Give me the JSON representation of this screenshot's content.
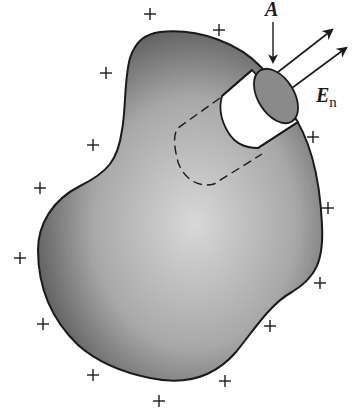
{
  "diagram": {
    "labels": {
      "area": "A",
      "field_main": "E",
      "field_subscript": "n"
    },
    "colors": {
      "ink": "#1a1a1a",
      "conductor_dark": "#4a4a4a",
      "conductor_light": "#d6d6d6",
      "end_cap": "#8a8a8a",
      "background": "#ffffff"
    },
    "surface_charges": {
      "symbol": "+",
      "count": 15,
      "positions": [
        [
          150,
          14
        ],
        [
          219,
          30
        ],
        [
          106,
          73
        ],
        [
          93,
          145
        ],
        [
          40,
          188
        ],
        [
          20,
          258
        ],
        [
          43,
          324
        ],
        [
          93,
          375
        ],
        [
          159,
          401
        ],
        [
          225,
          381
        ],
        [
          270,
          326
        ],
        [
          320,
          283
        ],
        [
          328,
          208
        ],
        [
          313,
          137
        ]
      ]
    },
    "field_arrows": 2,
    "area_arrow": 1
  }
}
